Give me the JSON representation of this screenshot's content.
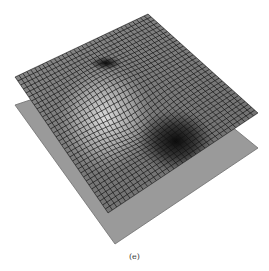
{
  "figure": {
    "caption": "(e)",
    "colors": {
      "plane": "#9a9a9a",
      "plane_edge": "#6e6e6e",
      "mesh_light": "#c8c8c8",
      "mesh_mid": "#888888",
      "mesh_dark": "#1a1a1a",
      "grid_line": "#141414"
    },
    "mesh": {
      "top": [
        148,
        14
      ],
      "left": [
        15,
        77
      ],
      "right": [
        258,
        113
      ],
      "bottom": [
        108,
        213
      ],
      "grid_divisions": 34
    },
    "plane": {
      "top": [
        150,
        60
      ],
      "left": [
        15,
        105
      ],
      "right": [
        258,
        148
      ],
      "bottom": [
        115,
        244
      ]
    },
    "features": {
      "dip_near_top": [
        106,
        63
      ],
      "peak_ridge": [
        110,
        110
      ],
      "deep_valley": [
        163,
        133
      ]
    }
  }
}
